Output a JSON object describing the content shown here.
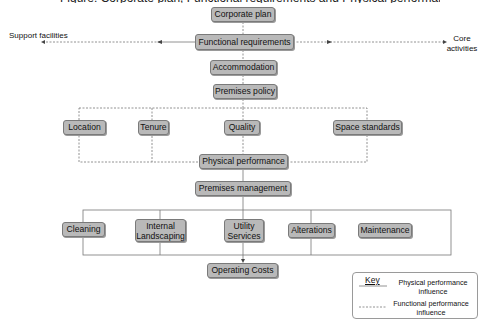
{
  "diagram": {
    "title_partial": "Figure: Corporate plan, Functional requirements and Physical performance influence on operating costs",
    "nodes": {
      "corporate_plan": "Corporate plan",
      "functional_requirements": "Functional requirements",
      "accommodation": "Accommodation",
      "premises_policy": "Premises policy",
      "location": "Location",
      "tenure": "Tenure",
      "quality": "Quality",
      "space_standards": "Space standards",
      "physical_performance": "Physical performance",
      "premises_management": "Premises management",
      "cleaning": "Cleaning",
      "internal_landscaping": "Internal Landscaping",
      "utility_services": "Utility Services",
      "alterations": "Alterations",
      "maintenance": "Maintenance",
      "operating_costs": "Operating Costs"
    },
    "side_labels": {
      "left": "Support facilities",
      "right": "Core activities"
    },
    "legend": {
      "title": "Key",
      "items": [
        {
          "style": "solid",
          "label": "Physical performance influence"
        },
        {
          "style": "dashed",
          "label": "Functional performance influence"
        }
      ]
    },
    "colors": {
      "box_fill": "#b9b9b9",
      "box_border": "#7a7a7a",
      "line": "#666666"
    }
  }
}
